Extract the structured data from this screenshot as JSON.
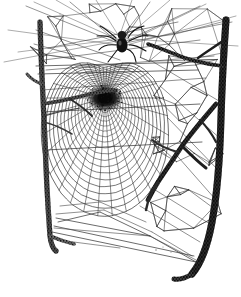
{
  "plate": {
    "title": "Orb Web of a Garden Spider",
    "medium": "pen-and-ink naturalist engraving",
    "caption": "",
    "width": 241,
    "height": 297,
    "background_color": "#ffffff",
    "ink_color": "#1a1a1a",
    "mid_ink_color": "#4a4a4a",
    "light_ink_color": "#6e6e6e"
  },
  "subjects": {
    "spider": {
      "label": "spider",
      "position": {
        "x": 122,
        "y": 42
      },
      "body_length": 15,
      "body_width": 11,
      "color": "#141414",
      "leg_count": 8,
      "legs": [
        {
          "x1": 116,
          "y1": 38,
          "x2": 100,
          "y2": 26
        },
        {
          "x1": 116,
          "y1": 41,
          "x2": 97,
          "y2": 36
        },
        {
          "x1": 116,
          "y1": 45,
          "x2": 99,
          "y2": 50
        },
        {
          "x1": 118,
          "y1": 49,
          "x2": 108,
          "y2": 62
        },
        {
          "x1": 128,
          "y1": 38,
          "x2": 144,
          "y2": 26
        },
        {
          "x1": 129,
          "y1": 41,
          "x2": 148,
          "y2": 36
        },
        {
          "x1": 129,
          "y1": 45,
          "x2": 146,
          "y2": 51
        },
        {
          "x1": 127,
          "y1": 49,
          "x2": 136,
          "y2": 62
        }
      ]
    },
    "orb_web": {
      "label": "orb web",
      "hub": {
        "x": 105,
        "y": 98
      },
      "hub_radius": 9,
      "radial_count": 34,
      "spiral_ring_count": 22,
      "outer_radius_x": 78,
      "outer_radius_y": 118,
      "perspective": "viewed obliquely, foreshortened toward the top"
    },
    "left_twig": {
      "label": "left supporting twig",
      "color": "#3a3a3a",
      "top": {
        "x": 40,
        "y": 22
      },
      "bottom": {
        "x": 52,
        "y": 250
      },
      "thickness": 4,
      "fork_count": 3
    },
    "right_twig": {
      "label": "right supporting twig",
      "color": "#1f1f1f",
      "top": {
        "x": 226,
        "y": 20
      },
      "bottom": {
        "x": 189,
        "y": 278
      },
      "thickness": 6,
      "fork_count": 2
    },
    "crossing_branch": {
      "label": "branch crossing the web",
      "color": "#242424",
      "from": {
        "x": 212,
        "y": 112
      },
      "to": {
        "x": 150,
        "y": 196
      },
      "thickness": 4
    },
    "scaffold_threads": {
      "label": "irregular scaffolding threads",
      "region": "upper and right of the orb",
      "color": "#303030"
    },
    "anchor_threads": {
      "label": "lower anchor threads",
      "color": "#3c3c3c"
    }
  },
  "geometry": {
    "frame_lines": [
      {
        "x1": 36,
        "y1": 66,
        "x2": 196,
        "y2": 62
      },
      {
        "x1": 38,
        "y1": 74,
        "x2": 198,
        "y2": 70
      },
      {
        "x1": 42,
        "y1": 112,
        "x2": 200,
        "y2": 104
      },
      {
        "x1": 46,
        "y1": 150,
        "x2": 202,
        "y2": 142
      }
    ],
    "bottom_anchors": [
      {
        "x1": 52,
        "y1": 232,
        "x2": 196,
        "y2": 262
      },
      {
        "x1": 54,
        "y1": 226,
        "x2": 194,
        "y2": 256
      },
      {
        "x1": 56,
        "y1": 218,
        "x2": 150,
        "y2": 236
      },
      {
        "x1": 100,
        "y1": 212,
        "x2": 150,
        "y2": 236
      },
      {
        "x1": 100,
        "y1": 212,
        "x2": 58,
        "y2": 222
      },
      {
        "x1": 150,
        "y1": 236,
        "x2": 196,
        "y2": 262
      }
    ],
    "upper_rays": [
      {
        "x1": 120,
        "y1": 44,
        "x2": 26,
        "y2": 6
      },
      {
        "x1": 120,
        "y1": 44,
        "x2": 70,
        "y2": 2
      },
      {
        "x1": 120,
        "y1": 44,
        "x2": 150,
        "y2": 2
      },
      {
        "x1": 120,
        "y1": 44,
        "x2": 200,
        "y2": 6
      },
      {
        "x1": 120,
        "y1": 44,
        "x2": 232,
        "y2": 22
      }
    ]
  }
}
